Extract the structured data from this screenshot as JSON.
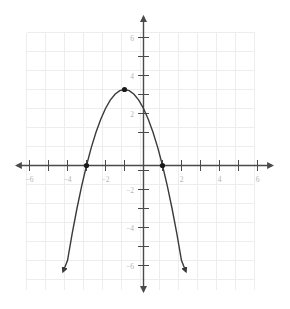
{
  "chart_data": {
    "type": "line",
    "title": "",
    "subtitle": "",
    "xlabel": "",
    "ylabel": "",
    "grid": true,
    "legend": false,
    "legend_position": "none",
    "function": "y = -(x + 3)(x - 1) = -x^2 - 2x + 3",
    "curve_shape": "downward-opening parabola",
    "xlim": [
      -6.5,
      6.5
    ],
    "ylim": [
      -6.5,
      6.5
    ],
    "x_ticks": [
      -6,
      -5,
      -4,
      -3,
      -2,
      -1,
      1,
      2,
      3,
      4,
      5,
      6
    ],
    "y_ticks": [
      -6,
      -5,
      -4,
      -3,
      -2,
      -1,
      1,
      2,
      3,
      4,
      5,
      6
    ],
    "x_tick_labels": [
      "−6",
      "−4",
      "−2",
      "2",
      "4",
      "6"
    ],
    "x_tick_label_values": [
      -6,
      -4,
      -2,
      2,
      4,
      6
    ],
    "y_tick_labels": [
      "6",
      "4",
      "2",
      "−2",
      "−4",
      "−6"
    ],
    "y_tick_label_values": [
      6,
      4,
      2,
      -2,
      -4,
      -6
    ],
    "grid_step": 1,
    "marked_points": [
      {
        "label": "vertex",
        "x": -1,
        "y": 4
      },
      {
        "label": "x-intercept-left",
        "x": -3,
        "y": 0
      },
      {
        "label": "x-intercept-right",
        "x": 1,
        "y": 0
      }
    ],
    "y_intercept": {
      "x": 0,
      "y": 3
    },
    "arrow_endpoints": [
      {
        "label": "left-arrow-end",
        "x": -4.22,
        "y": -5.55
      },
      {
        "label": "right-arrow-end",
        "x": 2.22,
        "y": -5.55
      }
    ],
    "x": [
      -4.22,
      -4.0,
      -3.75,
      -3.5,
      -3.25,
      -3.0,
      -2.75,
      -2.5,
      -2.25,
      -2.0,
      -1.75,
      -1.5,
      -1.25,
      -1.0,
      -0.75,
      -0.5,
      -0.25,
      0,
      0.25,
      0.5,
      0.75,
      1.0,
      1.25,
      1.5,
      1.75,
      2.0,
      2.22
    ],
    "values": [
      -5.55,
      -5.0,
      -3.56,
      -2.25,
      -1.06,
      0,
      0.94,
      1.75,
      2.44,
      3.0,
      3.44,
      3.75,
      3.94,
      4.0,
      3.94,
      3.75,
      3.44,
      3.0,
      2.44,
      1.75,
      0.94,
      0,
      -1.06,
      -2.25,
      -3.56,
      -5.0,
      -5.55
    ],
    "series": [
      {
        "name": "parabola",
        "color": "#3a3a3a",
        "x": [
          -4.22,
          -4.0,
          -3.75,
          -3.5,
          -3.25,
          -3.0,
          -2.75,
          -2.5,
          -2.25,
          -2.0,
          -1.75,
          -1.5,
          -1.25,
          -1.0,
          -0.75,
          -0.5,
          -0.25,
          0,
          0.25,
          0.5,
          0.75,
          1.0,
          1.25,
          1.5,
          1.75,
          2.0,
          2.22
        ],
        "values": [
          -5.55,
          -5.0,
          -3.56,
          -2.25,
          -1.06,
          0,
          0.94,
          1.75,
          2.44,
          3.0,
          3.44,
          3.75,
          3.94,
          4.0,
          3.94,
          3.75,
          3.44,
          3.0,
          2.44,
          1.75,
          0.94,
          0,
          -1.06,
          -2.25,
          -3.56,
          -5.0,
          -5.55
        ]
      }
    ]
  },
  "style": {
    "background": "#ffffff",
    "grid_color": "#ededed",
    "axis_color": "#4a4a4a",
    "curve_color": "#3a3a3a",
    "point_color": "#1a1a1a",
    "label_color": "#b5b5b5"
  },
  "a11y": {
    "figure_description": "Coordinate plane graph of a downward-opening parabola with vertex at (-1, 4), crossing the x-axis at -3 and 1 and the y-axis at 3."
  }
}
